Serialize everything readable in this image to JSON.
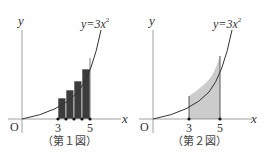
{
  "figures": [
    {
      "id": "fig1",
      "caption": "（第１図）",
      "y_axis_label": "y",
      "x_axis_label": "x",
      "origin_label": "O",
      "curve_label_prefix": "y=3x",
      "curve_label_exp": "2",
      "tick_labels": [
        "3",
        "5"
      ],
      "shading": "step rectangles (upper sum), 4 strips between x=3 and x=5"
    },
    {
      "id": "fig2",
      "caption": "（第２図）",
      "y_axis_label": "y",
      "x_axis_label": "x",
      "origin_label": "O",
      "curve_label_prefix": "y=3x",
      "curve_label_exp": "2",
      "tick_labels": [
        "3",
        "5"
      ],
      "shading": "vertical hatching under curve between x=3 and x=5"
    }
  ],
  "colors": {
    "axis": "#9a9a9a",
    "curve": "#333333",
    "fill": "#3a3a3a",
    "hatch": "#555555",
    "text": "#333333"
  }
}
